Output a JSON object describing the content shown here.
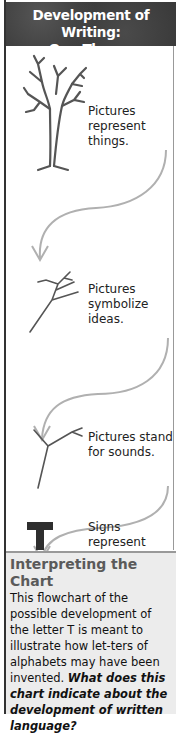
{
  "title": {
    "line1": "Development of Writing:",
    "line2": "One Theory"
  },
  "stages": [
    {
      "icon": "tree-icon",
      "label_line1": "Pictures",
      "label_line2": "represent things."
    },
    {
      "icon": "branch-icon",
      "label_line1": "Pictures",
      "label_line2": "symbolize ideas."
    },
    {
      "icon": "forked-stick-icon",
      "label_line1": "Pictures stand",
      "label_line2": "for sounds."
    },
    {
      "icon": "letter-t-icon",
      "label_line1": "Signs represent",
      "label_line2": "sounds."
    }
  ],
  "interpreting": {
    "heading": "Interpreting the Chart",
    "body": "This flowchart of the possible development of the letter T is meant to illustrate how let-ters of alphabets may have been invented.",
    "question": "What does this chart indicate about the development of written language?"
  },
  "colors": {
    "title_bg": "#3a3a3a",
    "arrow": "#b0b0b0",
    "box_bg": "#ececec",
    "heading": "#5a5a5a"
  }
}
